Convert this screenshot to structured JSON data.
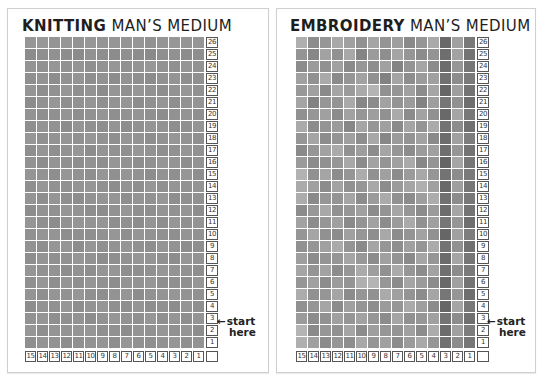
{
  "left": {
    "title_bold": "KNITTING",
    "title_rest": " MAN’S MEDIUM",
    "start_label_line1": "start",
    "start_label_line2": "here",
    "arrow": "←"
  },
  "right": {
    "title_bold": "EMBROIDERY",
    "title_rest": " MAN’S MEDIUM",
    "start_label_line1": "start",
    "start_label_line2": "here",
    "arrow": "←"
  },
  "grid": {
    "columns": 15,
    "rows": 26,
    "row_labels": [
      "26",
      "25",
      "24",
      "23",
      "22",
      "21",
      "20",
      "19",
      "18",
      "17",
      "16",
      "15",
      "14",
      "13",
      "12",
      "11",
      "10",
      "9",
      "8",
      "7",
      "6",
      "5",
      "4",
      "3",
      "2",
      "1"
    ],
    "column_labels": [
      "15",
      "14",
      "13",
      "12",
      "11",
      "10",
      "9",
      "8",
      "7",
      "6",
      "5",
      "4",
      "3",
      "2",
      "1"
    ]
  },
  "colors": {
    "border": "#cfcfcf",
    "label_border": "#555555",
    "text": "#1e1e1e"
  },
  "knitting_shades": [
    [
      150,
      152,
      148,
      150,
      147,
      151,
      149,
      150,
      148,
      150,
      146,
      149,
      151,
      148,
      150
    ],
    [
      140,
      143,
      145,
      141,
      139,
      146,
      142,
      140,
      144,
      141,
      138,
      143,
      145,
      140,
      142
    ],
    [
      148,
      145,
      150,
      146,
      149,
      144,
      147,
      150,
      145,
      148,
      151,
      146,
      144,
      149,
      147
    ],
    [
      143,
      147,
      141,
      145,
      148,
      142,
      146,
      141,
      147,
      143,
      140,
      145,
      148,
      142,
      144
    ],
    [
      149,
      142,
      146,
      150,
      143,
      147,
      141,
      149,
      144,
      150,
      146,
      142,
      147,
      150,
      145
    ],
    [
      141,
      146,
      150,
      143,
      146,
      149,
      144,
      147,
      150,
      141,
      145,
      149,
      143,
      146,
      148
    ],
    [
      147,
      143,
      144,
      148,
      142,
      146,
      149,
      143,
      146,
      148,
      144,
      141,
      146,
      148,
      143
    ],
    [
      143,
      148,
      146,
      141,
      149,
      144,
      142,
      148,
      141,
      145,
      149,
      147,
      142,
      144,
      149
    ],
    [
      150,
      144,
      147,
      149,
      145,
      150,
      146,
      143,
      149,
      147,
      142,
      146,
      150,
      147,
      144
    ],
    [
      142,
      149,
      143,
      146,
      150,
      141,
      148,
      146,
      144,
      150,
      147,
      143,
      145,
      149,
      146
    ],
    [
      146,
      141,
      148,
      144,
      142,
      147,
      143,
      150,
      146,
      142,
      145,
      150,
      148,
      141,
      147
    ],
    [
      149,
      147,
      142,
      150,
      146,
      143,
      150,
      144,
      149,
      146,
      141,
      147,
      143,
      150,
      142
    ],
    [
      143,
      150,
      146,
      145,
      148,
      150,
      145,
      141,
      147,
      143,
      150,
      144,
      149,
      146,
      148
    ],
    [
      148,
      142,
      149,
      143,
      141,
      146,
      148,
      149,
      142,
      148,
      146,
      150,
      142,
      143,
      145
    ],
    [
      141,
      147,
      145,
      150,
      147,
      142,
      141,
      146,
      150,
      144,
      143,
      148,
      146,
      149,
      141
    ],
    [
      150,
      144,
      141,
      146,
      149,
      148,
      150,
      142,
      145,
      141,
      149,
      142,
      150,
      144,
      148
    ],
    [
      145,
      149,
      148,
      142,
      144,
      143,
      146,
      150,
      143,
      149,
      147,
      145,
      143,
      148,
      146
    ],
    [
      147,
      143,
      150,
      149,
      141,
      150,
      144,
      147,
      149,
      145,
      142,
      149,
      147,
      141,
      143
    ],
    [
      142,
      148,
      144,
      145,
      150,
      146,
      141,
      143,
      146,
      150,
      148,
      144,
      141,
      150,
      147
    ],
    [
      149,
      145,
      147,
      141,
      146,
      142,
      149,
      150,
      142,
      143,
      145,
      150,
      148,
      146,
      142
    ],
    [
      144,
      150,
      142,
      148,
      143,
      149,
      145,
      141,
      148,
      147,
      150,
      142,
      144,
      143,
      150
    ],
    [
      148,
      143,
      149,
      146,
      150,
      144,
      142,
      147,
      150,
      141,
      146,
      148,
      150,
      147,
      145
    ],
    [
      141,
      147,
      145,
      150,
      142,
      148,
      150,
      144,
      143,
      149,
      142,
      145,
      141,
      148,
      143
    ],
    [
      146,
      149,
      143,
      144,
      147,
      141,
      146,
      150,
      147,
      144,
      150,
      143,
      149,
      142,
      148
    ],
    [
      150,
      142,
      148,
      147,
      149,
      150,
      143,
      145,
      141,
      148,
      146,
      150,
      145,
      149,
      141
    ],
    [
      143,
      148,
      146,
      141,
      144,
      147,
      149,
      142,
      150,
      145,
      143,
      147,
      150,
      144,
      147
    ]
  ],
  "embroidery_shades": [
    [
      175,
      140,
      150,
      168,
      160,
      145,
      165,
      148,
      158,
      138,
      150,
      170,
      105,
      160,
      120
    ],
    [
      148,
      135,
      162,
      145,
      168,
      132,
      155,
      142,
      165,
      150,
      140,
      148,
      110,
      162,
      115
    ],
    [
      140,
      155,
      145,
      160,
      138,
      150,
      142,
      160,
      132,
      148,
      165,
      140,
      108,
      150,
      118
    ],
    [
      160,
      145,
      170,
      138,
      150,
      162,
      145,
      130,
      165,
      142,
      155,
      160,
      112,
      140,
      122
    ],
    [
      152,
      160,
      138,
      165,
      155,
      170,
      180,
      145,
      150,
      160,
      140,
      165,
      102,
      158,
      115
    ],
    [
      165,
      130,
      150,
      148,
      170,
      135,
      140,
      162,
      148,
      155,
      130,
      158,
      118,
      145,
      110
    ],
    [
      145,
      150,
      160,
      140,
      162,
      150,
      158,
      145,
      170,
      140,
      162,
      145,
      105,
      165,
      120
    ],
    [
      170,
      140,
      148,
      155,
      135,
      165,
      150,
      160,
      138,
      165,
      148,
      170,
      115,
      140,
      112
    ],
    [
      150,
      165,
      140,
      148,
      160,
      142,
      168,
      135,
      155,
      148,
      162,
      138,
      108,
      160,
      125
    ],
    [
      138,
      150,
      162,
      170,
      145,
      158,
      140,
      165,
      150,
      140,
      155,
      160,
      110,
      150,
      115
    ],
    [
      155,
      140,
      145,
      150,
      168,
      140,
      162,
      148,
      160,
      170,
      135,
      148,
      100,
      165,
      118
    ],
    [
      178,
      145,
      165,
      140,
      150,
      172,
      145,
      160,
      140,
      155,
      168,
      150,
      115,
      140,
      122
    ],
    [
      170,
      160,
      140,
      162,
      145,
      150,
      168,
      140,
      155,
      165,
      175,
      160,
      105,
      158,
      118
    ],
    [
      172,
      138,
      150,
      148,
      165,
      140,
      155,
      170,
      145,
      140,
      158,
      172,
      112,
      140,
      120
    ],
    [
      140,
      152,
      168,
      145,
      150,
      160,
      140,
      148,
      165,
      150,
      140,
      155,
      108,
      165,
      115
    ],
    [
      162,
      140,
      150,
      160,
      138,
      148,
      162,
      140,
      155,
      170,
      145,
      160,
      118,
      150,
      110
    ],
    [
      150,
      165,
      145,
      140,
      160,
      150,
      142,
      168,
      140,
      148,
      162,
      145,
      102,
      160,
      125
    ],
    [
      145,
      150,
      160,
      170,
      148,
      138,
      165,
      150,
      142,
      160,
      150,
      170,
      115,
      145,
      112
    ],
    [
      158,
      140,
      148,
      150,
      165,
      152,
      140,
      160,
      148,
      138,
      165,
      150,
      108,
      165,
      118
    ],
    [
      165,
      148,
      162,
      140,
      150,
      170,
      158,
      145,
      170,
      150,
      140,
      162,
      112,
      140,
      122
    ],
    [
      150,
      160,
      140,
      155,
      148,
      175,
      180,
      150,
      140,
      165,
      155,
      140,
      105,
      160,
      115
    ],
    [
      172,
      145,
      150,
      165,
      140,
      150,
      145,
      170,
      160,
      148,
      140,
      165,
      118,
      150,
      110
    ],
    [
      145,
      150,
      165,
      140,
      160,
      148,
      142,
      155,
      150,
      170,
      158,
      140,
      102,
      165,
      120
    ],
    [
      155,
      140,
      145,
      160,
      150,
      162,
      150,
      140,
      165,
      145,
      150,
      160,
      115,
      140,
      112
    ],
    [
      180,
      138,
      150,
      145,
      165,
      140,
      158,
      150,
      148,
      160,
      140,
      172,
      108,
      160,
      125
    ],
    [
      175,
      160,
      140,
      150,
      142,
      168,
      150,
      160,
      140,
      155,
      168,
      150,
      112,
      140,
      118
    ]
  ]
}
